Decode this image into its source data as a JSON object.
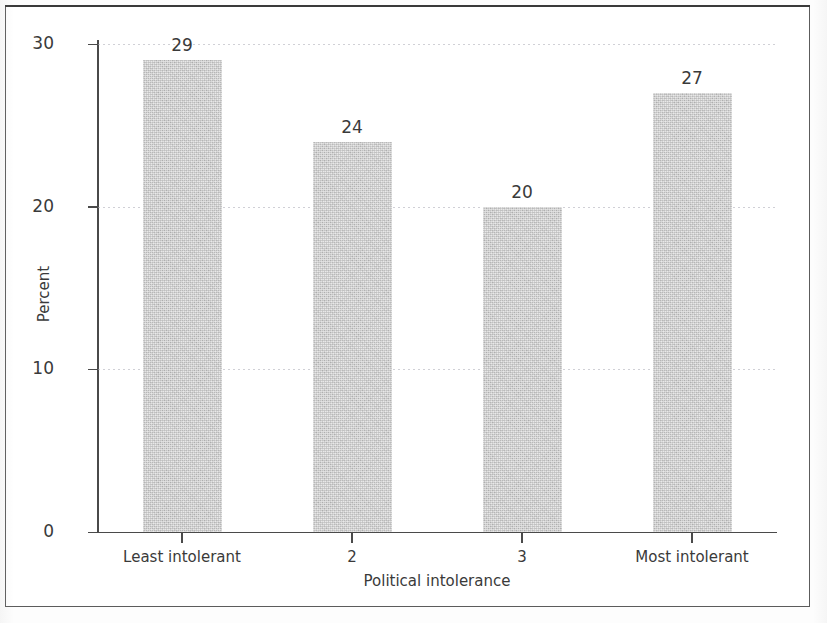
{
  "figure": {
    "frame_color": "#5c5c5c",
    "background": "#ffffff"
  },
  "chart_data": {
    "type": "bar",
    "title": "",
    "subtitle": "",
    "categories": [
      "Least intolerant",
      "2",
      "3",
      "Most intolerant"
    ],
    "values": [
      29,
      24,
      20,
      27
    ],
    "bar_labels": [
      "29",
      "24",
      "20",
      "27"
    ],
    "xlabel": "Political intolerance",
    "ylabel": "Percent",
    "ylim": [
      0,
      30
    ],
    "yticks": [
      0,
      10,
      20,
      30
    ],
    "ytick_labels": [
      "0",
      "10",
      "20",
      "30"
    ],
    "grid": "horizontal-dotted",
    "legend": "none",
    "bar_color": "#c9c9c9",
    "axis_color": "#4a4a4a",
    "text_color": "#3a3a3a",
    "orientation": "vertical",
    "series": [
      {
        "name": "Percent",
        "values": [
          29,
          24,
          20,
          27
        ]
      }
    ]
  }
}
